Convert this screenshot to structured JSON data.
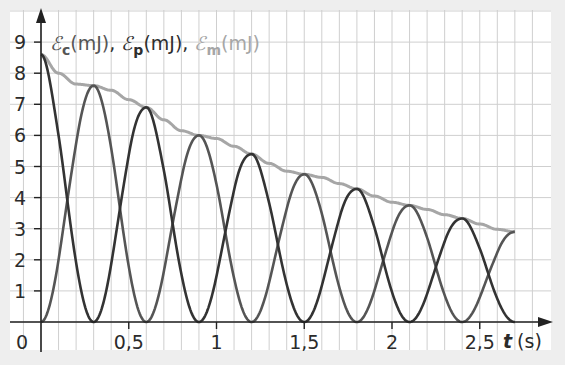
{
  "chart_data": {
    "type": "line",
    "title": "",
    "ylabel": "𝓔c(mJ), 𝓔p(mJ), 𝓔m(mJ)",
    "legend": [
      {
        "symbol": "ℰ",
        "sub": "c",
        "unit": "(mJ)",
        "text": "Ec(mJ)",
        "color": "#555555"
      },
      {
        "symbol": "ℰ",
        "sub": "p",
        "unit": "(mJ)",
        "text": "Ep(mJ)",
        "color": "#2e2e2e"
      },
      {
        "symbol": "ℰ",
        "sub": "m",
        "unit": "(mJ)",
        "text": "Em(mJ)",
        "color": "#a6a6a6"
      }
    ],
    "legend_separator": ", ",
    "xlabel": {
      "var": "t",
      "unit": "(s)"
    },
    "x_ticks": [
      {
        "value": 0,
        "label": "0"
      },
      {
        "value": 0.5,
        "label": "0,5"
      },
      {
        "value": 1,
        "label": "1"
      },
      {
        "value": 1.5,
        "label": "1,5"
      },
      {
        "value": 2,
        "label": "2"
      },
      {
        "value": 2.5,
        "label": "2,5"
      }
    ],
    "y_ticks": [
      1,
      2,
      3,
      4,
      5,
      6,
      7,
      8,
      9
    ],
    "xlim": [
      0,
      2.8
    ],
    "ylim": [
      0,
      9.5
    ],
    "grid": {
      "x_step": 0.1,
      "y_step": 1
    },
    "half_period_s": 0.3,
    "series": [
      {
        "name": "Em",
        "color": "#a6a6a6",
        "t": [
          0,
          0.1,
          0.2,
          0.3,
          0.4,
          0.5,
          0.6,
          0.7,
          0.8,
          0.9,
          1.0,
          1.1,
          1.2,
          1.3,
          1.4,
          1.5,
          1.6,
          1.7,
          1.8,
          1.9,
          2.0,
          2.1,
          2.2,
          2.3,
          2.4,
          2.5,
          2.6,
          2.7
        ],
        "values": [
          8.6,
          8.0,
          7.65,
          7.6,
          7.45,
          7.15,
          6.9,
          6.5,
          6.15,
          6.0,
          5.9,
          5.65,
          5.4,
          5.1,
          4.85,
          4.75,
          4.65,
          4.45,
          4.28,
          4.05,
          3.85,
          3.75,
          3.62,
          3.45,
          3.33,
          3.15,
          2.98,
          2.9
        ]
      },
      {
        "name": "Ec",
        "color": "#333333",
        "description": "Ec = Em·cos²(πt/0.6); peaks at t=0, 0.6, 1.2, 1.8, 2.4; zeros at t=0.3, 0.9, 1.5, 2.1, 2.7"
      },
      {
        "name": "Ep",
        "color": "#555555",
        "description": "Ep = Em − Ec; peaks at t=0.3, 0.9, 1.5, 2.1, 2.7; zeros at t=0, 0.6, 1.2, 1.8, 2.4"
      }
    ]
  }
}
